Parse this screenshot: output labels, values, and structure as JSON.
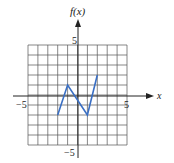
{
  "chart_data": {
    "type": "line",
    "title": "",
    "xlabel": "x",
    "ylabel": "f(x)",
    "xlim": [
      -5,
      5
    ],
    "ylim": [
      -5,
      5
    ],
    "grid": true,
    "x_tick_labels": [
      "-5",
      "5"
    ],
    "y_tick_labels": [
      "5",
      "-5"
    ],
    "series": [
      {
        "name": "f(x)",
        "color": "#3a6fc4",
        "x": [
          -2,
          -1,
          1,
          2
        ],
        "y": [
          -2,
          1,
          -2,
          2
        ]
      }
    ]
  },
  "labels": {
    "y_axis": "f(x)",
    "x_axis": "x",
    "x_min": "−5",
    "x_max": "5",
    "y_max": "5",
    "y_min": "−5"
  }
}
